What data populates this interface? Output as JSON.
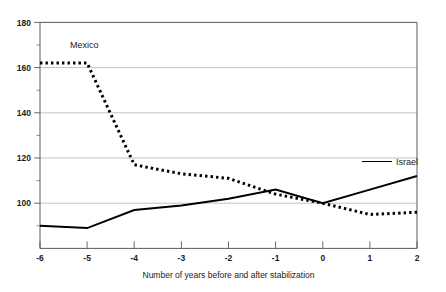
{
  "chart_data": {
    "type": "line",
    "title": "",
    "subtitle": "",
    "xlabel": "Number of years before and after stabilization",
    "ylabel": "",
    "xlim": [
      -6,
      2
    ],
    "ylim": [
      80,
      180
    ],
    "x": [
      -6,
      -5,
      -4,
      -3,
      -2,
      -1,
      0,
      1,
      2
    ],
    "xticklabels": [
      "-6",
      "-5",
      "-4",
      "-3",
      "-2",
      "-1",
      "0",
      "1",
      "2"
    ],
    "yticks": [
      100,
      120,
      140,
      160,
      180
    ],
    "yticklabels": [
      "100",
      "120",
      "140",
      "160",
      "180"
    ],
    "yticks_minor": [
      90,
      110,
      130,
      150,
      170
    ],
    "grid": "horizontal",
    "legend_position": "inline-annotations",
    "series": [
      {
        "name": "Mexico",
        "style": "dotted",
        "color": "#000000",
        "values": [
          162,
          162,
          117,
          113,
          111,
          104,
          100,
          95,
          96
        ]
      },
      {
        "name": "Israel",
        "style": "solid",
        "color": "#000000",
        "values": [
          90,
          89,
          97,
          99,
          102,
          106,
          100,
          106,
          112
        ]
      }
    ],
    "annotations": [
      {
        "text": "Mexico",
        "x": -5.15,
        "y": 171
      },
      {
        "text": "Israel",
        "x": 1.45,
        "y": 118
      }
    ]
  },
  "axis": {
    "y_label_180": "180",
    "y_label_160": "160",
    "y_label_140": "140",
    "y_label_120": "120",
    "y_label_100": "100",
    "x_label_m6": "-6",
    "x_label_m5": "-5",
    "x_label_m4": "-4",
    "x_label_m3": "-3",
    "x_label_m2": "-2",
    "x_label_m1": "-1",
    "x_label_0": "0",
    "x_label_1": "1",
    "x_label_2": "2",
    "x_title": "Number of years before and after stabilization"
  },
  "labels": {
    "mexico": "Mexico",
    "israel": "Israel"
  }
}
